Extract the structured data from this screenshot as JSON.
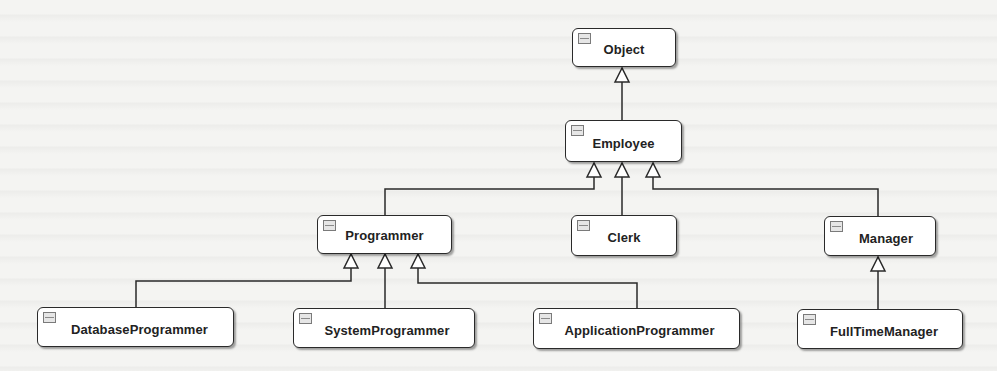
{
  "diagram": {
    "type": "UML class hierarchy",
    "classes": {
      "object": {
        "name": "Object"
      },
      "employee": {
        "name": "Employee"
      },
      "programmer": {
        "name": "Programmer"
      },
      "clerk": {
        "name": "Clerk"
      },
      "manager": {
        "name": "Manager"
      },
      "database_programmer": {
        "name": "DatabaseProgrammer"
      },
      "system_programmer": {
        "name": "SystemProgrammer"
      },
      "application_programmer": {
        "name": "ApplicationProgrammer"
      },
      "full_time_manager": {
        "name": "FullTimeManager"
      }
    },
    "relationships": [
      {
        "child": "Employee",
        "parent": "Object",
        "kind": "generalization"
      },
      {
        "child": "Programmer",
        "parent": "Employee",
        "kind": "generalization"
      },
      {
        "child": "Clerk",
        "parent": "Employee",
        "kind": "generalization"
      },
      {
        "child": "Manager",
        "parent": "Employee",
        "kind": "generalization"
      },
      {
        "child": "DatabaseProgrammer",
        "parent": "Programmer",
        "kind": "generalization"
      },
      {
        "child": "SystemProgrammer",
        "parent": "Programmer",
        "kind": "generalization"
      },
      {
        "child": "ApplicationProgrammer",
        "parent": "Programmer",
        "kind": "generalization"
      },
      {
        "child": "FullTimeManager",
        "parent": "Manager",
        "kind": "generalization"
      }
    ],
    "colors": {
      "box_fill": "#ffffff",
      "box_border": "#2a2a2a",
      "line": "#2a2a2a",
      "background": "#f4f4f2"
    }
  }
}
